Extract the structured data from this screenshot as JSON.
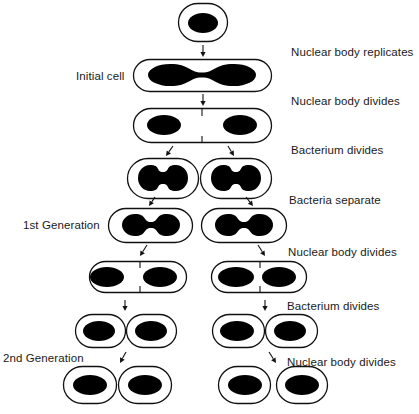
{
  "colors": {
    "outline": "#111111",
    "nucleus": "#000000",
    "background": "#ffffff",
    "text": "#1a1a1a"
  },
  "stage_labels": [
    {
      "id": "nuclear-body-replicates",
      "text": "Nuclear body replicates",
      "x": 291,
      "y": 45
    },
    {
      "id": "nuclear-body-divides-1",
      "text": "Nuclear body divides",
      "x": 291,
      "y": 94
    },
    {
      "id": "bacterium-divides-1",
      "text": "Bacterium divides",
      "x": 291,
      "y": 143
    },
    {
      "id": "bacteria-separate",
      "text": "Bacteria separate",
      "x": 289,
      "y": 193
    },
    {
      "id": "nuclear-body-divides-2",
      "text": "Nuclear body divides",
      "x": 288,
      "y": 245
    },
    {
      "id": "bacterium-divides-2",
      "text": "Bacterium divides",
      "x": 287,
      "y": 299
    },
    {
      "id": "nuclear-body-divides-3",
      "text": "Nuclear body divides",
      "x": 287,
      "y": 355
    }
  ],
  "generation_labels": [
    {
      "id": "initial-cell",
      "text": "Initial cell",
      "x": 76,
      "y": 69
    },
    {
      "id": "first-generation",
      "text": "1st Generation",
      "x": 23,
      "y": 218
    },
    {
      "id": "second-generation",
      "text": "2nd Generation",
      "x": 3,
      "y": 351
    }
  ],
  "cells": [
    {
      "id": "top-cell",
      "x": 178,
      "y": 3,
      "w": 50,
      "h": 39
    },
    {
      "id": "elongated-cell",
      "x": 133,
      "y": 59,
      "w": 139,
      "h": 33
    },
    {
      "id": "septum-cell",
      "x": 133,
      "y": 108,
      "w": 139,
      "h": 35
    },
    {
      "id": "pair-left",
      "x": 127,
      "y": 158,
      "w": 72,
      "h": 41
    },
    {
      "id": "pair-right",
      "x": 200,
      "y": 158,
      "w": 72,
      "h": 41
    },
    {
      "id": "gen1-left",
      "x": 108,
      "y": 208,
      "w": 85,
      "h": 35
    },
    {
      "id": "gen1-right",
      "x": 201,
      "y": 208,
      "w": 86,
      "h": 35
    },
    {
      "id": "gen1-left-septum",
      "x": 89,
      "y": 261,
      "w": 98,
      "h": 32
    },
    {
      "id": "gen1-right-septum",
      "x": 211,
      "y": 261,
      "w": 96,
      "h": 32
    },
    {
      "id": "row7-a",
      "x": 75,
      "y": 314,
      "w": 51,
      "h": 34
    },
    {
      "id": "row7-b",
      "x": 126,
      "y": 314,
      "w": 51,
      "h": 34
    },
    {
      "id": "row7-c",
      "x": 212,
      "y": 314,
      "w": 53,
      "h": 34
    },
    {
      "id": "row7-d",
      "x": 265,
      "y": 314,
      "w": 53,
      "h": 34
    },
    {
      "id": "gen2-a",
      "x": 63,
      "y": 366,
      "w": 54,
      "h": 38
    },
    {
      "id": "gen2-b",
      "x": 118,
      "y": 366,
      "w": 54,
      "h": 38
    },
    {
      "id": "gen2-c",
      "x": 218,
      "y": 366,
      "w": 53,
      "h": 38
    },
    {
      "id": "gen2-d",
      "x": 276,
      "y": 366,
      "w": 52,
      "h": 38
    }
  ],
  "nuclei_ovals": [
    {
      "cx": 203,
      "cy": 23,
      "rx": 15,
      "ry": 10
    },
    {
      "cx": 164,
      "cy": 125,
      "rx": 17,
      "ry": 10
    },
    {
      "cx": 240,
      "cy": 125,
      "rx": 17,
      "ry": 10
    },
    {
      "cx": 107,
      "cy": 277,
      "rx": 17,
      "ry": 10
    },
    {
      "cx": 160,
      "cy": 277,
      "rx": 17,
      "ry": 10
    },
    {
      "cx": 236,
      "cy": 277,
      "rx": 18,
      "ry": 10
    },
    {
      "cx": 279,
      "cy": 277,
      "rx": 17,
      "ry": 10
    },
    {
      "cx": 99,
      "cy": 331,
      "rx": 16,
      "ry": 10
    },
    {
      "cx": 151,
      "cy": 331,
      "rx": 16,
      "ry": 10
    },
    {
      "cx": 237,
      "cy": 331,
      "rx": 17,
      "ry": 10
    },
    {
      "cx": 290,
      "cy": 331,
      "rx": 16,
      "ry": 10
    },
    {
      "cx": 90,
      "cy": 385,
      "rx": 17,
      "ry": 10
    },
    {
      "cx": 145,
      "cy": 385,
      "rx": 17,
      "ry": 10
    },
    {
      "cx": 245,
      "cy": 385,
      "rx": 17,
      "ry": 10
    },
    {
      "cx": 302,
      "cy": 385,
      "rx": 17,
      "ry": 10
    }
  ],
  "nuclei_dumbbells": [
    {
      "id": "replicating",
      "cx": 202,
      "cy": 75,
      "half": 54,
      "lobe_rx": 22,
      "lobe_ry": 11,
      "neck": 2.5
    },
    {
      "id": "pair-left-nuc",
      "cx": 163,
      "cy": 178,
      "half": 25,
      "lobe_rx": 12,
      "lobe_ry": 13,
      "neck": 6
    },
    {
      "id": "pair-right-nuc",
      "cx": 236,
      "cy": 178,
      "half": 25,
      "lobe_rx": 12,
      "lobe_ry": 13,
      "neck": 6
    },
    {
      "id": "gen1-left-nuc",
      "cx": 151,
      "cy": 225,
      "half": 29,
      "lobe_rx": 13,
      "lobe_ry": 11,
      "neck": 3
    },
    {
      "id": "gen1-right-nuc",
      "cx": 244,
      "cy": 225,
      "half": 29,
      "lobe_rx": 13,
      "lobe_ry": 11,
      "neck": 3
    }
  ],
  "septa": [
    {
      "x": 202,
      "y1": 108,
      "y2": 116
    },
    {
      "x": 202,
      "y1": 136,
      "y2": 143
    },
    {
      "x": 140,
      "y1": 261,
      "y2": 268
    },
    {
      "x": 140,
      "y1": 286,
      "y2": 293
    },
    {
      "x": 260,
      "y1": 261,
      "y2": 268
    },
    {
      "x": 260,
      "y1": 286,
      "y2": 293
    }
  ],
  "arrows": [
    {
      "x1": 203,
      "y1": 45,
      "x2": 203,
      "y2": 57
    },
    {
      "x1": 203,
      "y1": 94,
      "x2": 203,
      "y2": 106
    },
    {
      "x1": 173,
      "y1": 146,
      "x2": 166,
      "y2": 156
    },
    {
      "x1": 228,
      "y1": 146,
      "x2": 234,
      "y2": 156
    },
    {
      "x1": 155,
      "y1": 197,
      "x2": 149,
      "y2": 206
    },
    {
      "x1": 246,
      "y1": 197,
      "x2": 253,
      "y2": 206
    },
    {
      "x1": 147,
      "y1": 245,
      "x2": 140,
      "y2": 256
    },
    {
      "x1": 258,
      "y1": 245,
      "x2": 265,
      "y2": 256
    },
    {
      "x1": 125,
      "y1": 300,
      "x2": 125,
      "y2": 311
    },
    {
      "x1": 265,
      "y1": 300,
      "x2": 265,
      "y2": 311
    },
    {
      "x1": 126,
      "y1": 352,
      "x2": 120,
      "y2": 363
    },
    {
      "x1": 269,
      "y1": 352,
      "x2": 276,
      "y2": 363
    }
  ]
}
